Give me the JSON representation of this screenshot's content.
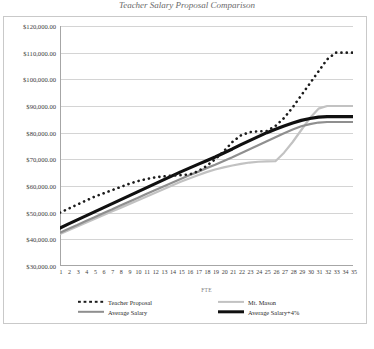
{
  "chart_data": {
    "type": "line",
    "title": "Teacher Salary Proposal Comparison",
    "xlabel": "FTE",
    "ylabel": "",
    "grid": true,
    "legend_position": "bottom",
    "x": [
      1,
      2,
      3,
      4,
      5,
      6,
      7,
      8,
      9,
      10,
      11,
      12,
      13,
      14,
      15,
      16,
      17,
      18,
      19,
      20,
      21,
      22,
      23,
      24,
      25,
      26,
      27,
      28,
      29,
      30,
      31,
      32,
      33,
      34,
      35
    ],
    "xtick_labels": [
      "1",
      "2",
      "3",
      "4",
      "5",
      "6",
      "7",
      "8",
      "9",
      "10",
      "11",
      "12",
      "13",
      "14",
      "15",
      "16",
      "17",
      "18",
      "19",
      "20",
      "21",
      "22",
      "23",
      "24",
      "25",
      "26",
      "27",
      "28",
      "29",
      "30",
      "31",
      "32",
      "33",
      "34",
      "35"
    ],
    "ytick_labels": [
      "$30,000.00",
      "$40,000.00",
      "$50,000.00",
      "$60,000.00",
      "$70,000.00",
      "$80,000.00",
      "$90,000.00",
      "$100,000.00",
      "$110,000.00",
      "$120,000.00"
    ],
    "ytick_values": [
      30000,
      40000,
      50000,
      60000,
      70000,
      80000,
      90000,
      100000,
      110000,
      120000
    ],
    "ylim": [
      30000,
      120000
    ],
    "series": [
      {
        "name": "Teacher Proposal",
        "style": "dotted",
        "color": "#1b1b1b",
        "values": [
          50000,
          51500,
          53000,
          54500,
          56000,
          57200,
          58400,
          59600,
          60800,
          61800,
          62600,
          63200,
          63600,
          63900,
          64100,
          64300,
          65500,
          67500,
          70000,
          73000,
          76500,
          79000,
          80200,
          80500,
          80600,
          82500,
          85500,
          89500,
          94000,
          98500,
          103000,
          107500,
          110000,
          110000,
          110000
        ]
      },
      {
        "name": "Mt. Mason",
        "style": "solid",
        "color": "#c2c2c2",
        "values": [
          42000,
          43400,
          44800,
          46200,
          47600,
          49000,
          50400,
          51800,
          53200,
          54600,
          56000,
          57400,
          58800,
          60200,
          61600,
          62800,
          64000,
          65200,
          66200,
          67000,
          67700,
          68300,
          68800,
          69100,
          69200,
          69300,
          72500,
          76500,
          81000,
          85500,
          89000,
          90000,
          90000,
          90000,
          90000
        ]
      },
      {
        "name": "Average Salary",
        "style": "solid",
        "color": "#8f8f8f",
        "values": [
          42500,
          44000,
          45400,
          46900,
          48300,
          49800,
          51200,
          52700,
          54100,
          55500,
          57000,
          58400,
          59800,
          61200,
          62600,
          64000,
          65300,
          66700,
          68000,
          69400,
          70800,
          72300,
          73800,
          75300,
          76800,
          78300,
          79800,
          81200,
          82400,
          83200,
          83800,
          84000,
          84000,
          84000,
          84000
        ]
      },
      {
        "name": "Average Salary+4%",
        "style": "solid-bold",
        "color": "#101010",
        "values": [
          44200,
          45800,
          47300,
          48800,
          50300,
          51800,
          53300,
          54800,
          56300,
          57800,
          59300,
          60800,
          62300,
          63800,
          65300,
          66700,
          68100,
          69500,
          70900,
          72400,
          73900,
          75500,
          77000,
          78500,
          80000,
          81300,
          82500,
          83600,
          84600,
          85300,
          85800,
          86000,
          86000,
          86000,
          86000
        ]
      }
    ]
  },
  "legend": {
    "items": [
      {
        "label": "Teacher Proposal"
      },
      {
        "label": "Mt. Mason"
      },
      {
        "label": "Average Salary"
      },
      {
        "label": "Average Salary+4%"
      }
    ]
  }
}
